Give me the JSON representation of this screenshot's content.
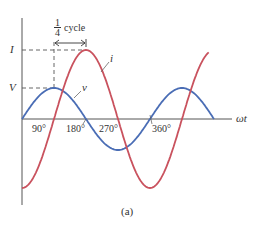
{
  "figure": {
    "caption": "(a)",
    "axis_label_x": "ωt",
    "y_labels": {
      "current_peak": "I",
      "voltage_peak": "V"
    },
    "curve_labels": {
      "current": "i",
      "voltage": "v"
    },
    "annotation": {
      "fraction_num": "1",
      "fraction_den": "4",
      "text": "cycle"
    },
    "tick_labels": [
      "90°",
      "180°",
      "270°",
      "360°"
    ],
    "colors": {
      "current": "#c9525e",
      "voltage": "#4a6db5",
      "axis": "#555555",
      "dash": "#555555"
    }
  },
  "chart_data": {
    "type": "line",
    "title": "",
    "xlabel": "ωt",
    "ylabel": "",
    "x_ticks": [
      "90°",
      "180°",
      "270°",
      "360°"
    ],
    "xlim_deg": [
      0,
      540
    ],
    "series": [
      {
        "name": "v",
        "description": "voltage, V·sin(ωt)",
        "amplitude_label": "V",
        "peak_at_deg": 90,
        "relative_amplitude": 0.45
      },
      {
        "name": "i",
        "description": "current, lags voltage by 90°, −I·cos(ωt)",
        "amplitude_label": "I",
        "peak_at_deg": 180,
        "relative_amplitude": 1.0
      }
    ],
    "annotations": [
      "1/4 cycle (phase difference between v peak and i peak)"
    ]
  }
}
